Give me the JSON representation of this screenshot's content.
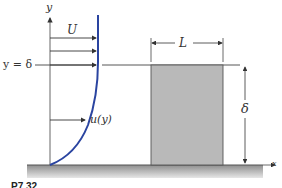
{
  "diagram": {
    "labels": {
      "y_axis": "y",
      "x_axis": "x",
      "freestream_velocity": "U",
      "boundary_layer_edge": "y = δ",
      "velocity_profile": "u(y)",
      "plate_length": "L",
      "thickness": "δ"
    },
    "caption": "P7.32",
    "colors": {
      "profile_curve": "#2a44a0",
      "block_fill": "#b9b9b9",
      "ground": "#9a9a9a",
      "lines": "#444444"
    }
  }
}
